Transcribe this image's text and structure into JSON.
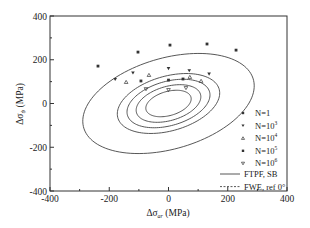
{
  "chart_data": {
    "type": "scatter",
    "title": "",
    "xlabel": "Δσ_ar (MPa)",
    "ylabel": "Δσ_ψ (MPa)",
    "xlim": [
      -400,
      400
    ],
    "ylim": [
      -400,
      400
    ],
    "x_ticks": [
      -400,
      -200,
      0,
      200,
      400
    ],
    "y_ticks": [
      -400,
      -200,
      0,
      200,
      400
    ],
    "x_minor_ticks": [
      -300,
      -100,
      100,
      300
    ],
    "y_minor_ticks": [
      -300,
      -100,
      100,
      300
    ],
    "grid": false,
    "legend_position": "lower right (inside)",
    "series": [
      {
        "name": "N=1",
        "marker": "square",
        "points": [
          [
            -238,
            171
          ],
          [
            -103,
            235
          ],
          [
            5,
            267
          ],
          [
            130,
            272
          ],
          [
            228,
            244
          ]
        ]
      },
      {
        "name": "N=10³",
        "marker": "triangle-down",
        "points": [
          [
            -180,
            110
          ],
          [
            -120,
            140
          ],
          [
            0,
            160
          ],
          [
            70,
            150
          ],
          [
            137,
            135
          ]
        ]
      },
      {
        "name": "N=10⁴",
        "marker": "triangle-up",
        "points": [
          [
            -143,
            98
          ],
          [
            -66,
            130
          ],
          [
            72,
            121
          ],
          [
            110,
            103
          ]
        ]
      },
      {
        "name": "N=10⁵",
        "marker": "square",
        "points": [
          [
            -93,
            103
          ],
          [
            0,
            107
          ],
          [
            49,
            112
          ]
        ]
      },
      {
        "name": "N=10⁶",
        "marker": "triangle-down-open",
        "points": [
          [
            -76,
            66
          ],
          [
            0,
            62
          ],
          [
            59,
            71
          ]
        ]
      }
    ],
    "curves": [
      {
        "name": "FTPF, SB",
        "style": "solid",
        "description": "concentric tilted ellipses (one per N level)",
        "ellipses": [
          {
            "level": "N=1",
            "rx": 310,
            "ry": 200,
            "angle_deg": 28
          },
          {
            "level": "N=10³",
            "rx": 185,
            "ry": 120,
            "angle_deg": 28
          },
          {
            "level": "N=10⁴",
            "rx": 150,
            "ry": 97,
            "angle_deg": 28
          },
          {
            "level": "N=10⁵",
            "rx": 117,
            "ry": 75,
            "angle_deg": 28
          },
          {
            "level": "N=10⁶",
            "rx": 82,
            "ry": 53,
            "angle_deg": 28
          }
        ]
      },
      {
        "name": "FWE, ref 0°",
        "style": "dashed",
        "description": "legend entry only"
      }
    ]
  },
  "axes": {
    "x_tick_labels": [
      "-400",
      "-200",
      "0",
      "200",
      "400"
    ],
    "y_tick_labels": [
      "400",
      "200",
      "0",
      "-200",
      "-400"
    ],
    "xlabel_main": "Δσ",
    "xlabel_sub": "ar",
    "xlabel_unit": " (MPa)",
    "ylabel_main": "Δσ",
    "ylabel_sub": "ψ",
    "ylabel_unit": " (MPa)"
  },
  "legend": {
    "items": [
      {
        "label": "N=1",
        "base": "N=1",
        "exp": ""
      },
      {
        "label": "N=10³",
        "base": "N=10",
        "exp": "3"
      },
      {
        "label": "N=10⁴",
        "base": "N=10",
        "exp": "4"
      },
      {
        "label": "N=10⁵",
        "base": "N=10",
        "exp": "5"
      },
      {
        "label": "N=10⁶",
        "base": "N=10",
        "exp": "6"
      }
    ],
    "line_items": [
      {
        "label": "FTPF, SB",
        "style": "solid"
      },
      {
        "label": "FWE, ref 0°",
        "style": "dashed"
      }
    ]
  },
  "colors": {
    "axis": "#333333",
    "curve": "#444444",
    "marker": "#333333",
    "background": "#ffffff"
  }
}
